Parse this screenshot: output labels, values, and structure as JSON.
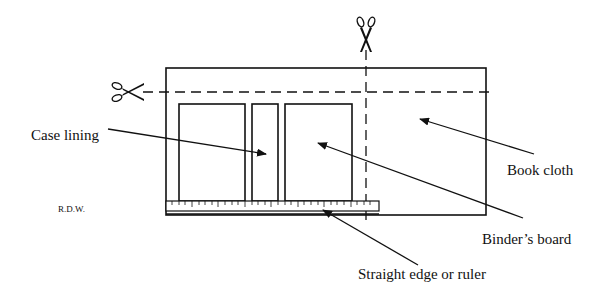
{
  "diagram": {
    "labels": {
      "case_lining": "Case lining",
      "book_cloth": "Book cloth",
      "binders_board": "Binder’s board",
      "straight_edge": "Straight edge or ruler",
      "initials": "R.D.W."
    },
    "icons": {
      "scissors_top": "scissors-icon",
      "scissors_left": "scissors-icon"
    },
    "colors": {
      "line": "#111111",
      "background": "#ffffff"
    }
  }
}
